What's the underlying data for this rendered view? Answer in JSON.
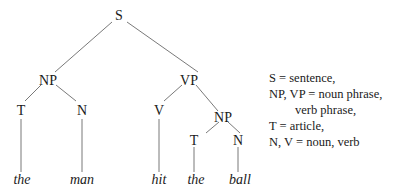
{
  "tree": {
    "nodes": {
      "S": "S",
      "NP1": "NP",
      "VP": "VP",
      "T1": "T",
      "N1": "N",
      "V": "V",
      "NP2": "NP",
      "T2": "T",
      "N2": "N"
    },
    "leaves": {
      "the1": "the",
      "man": "man",
      "hit": "hit",
      "the2": "the",
      "ball": "ball"
    }
  },
  "legend": {
    "lines": [
      "S = sentence,",
      "NP, VP = noun phrase,",
      "verb phrase,",
      "T = article,",
      "N, V = noun, verb"
    ]
  }
}
